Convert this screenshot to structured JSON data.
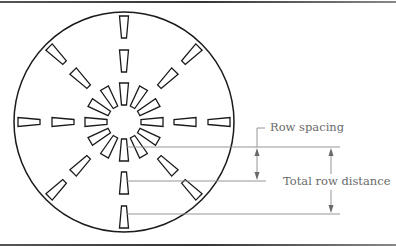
{
  "diagram": {
    "title": "",
    "type": "radial drill-hole pattern with row spacing dimensions",
    "circle": {
      "cx": 124,
      "cy": 122,
      "r": 110
    },
    "rings": [
      {
        "name": "inner",
        "count": 12,
        "r_inner": 17,
        "r_outer": 39
      },
      {
        "name": "middle",
        "count": 8,
        "r_inner": 50,
        "r_outer": 72
      },
      {
        "name": "outer",
        "count": 8,
        "r_inner": 84,
        "r_outer": 106
      }
    ],
    "labels": {
      "row_spacing": "Row spacing",
      "total_row_distance": "Total row distance"
    },
    "colors": {
      "stroke": "#1a1a1a",
      "dimension": "#7a7a7a",
      "text": "#6a6a6a"
    }
  }
}
